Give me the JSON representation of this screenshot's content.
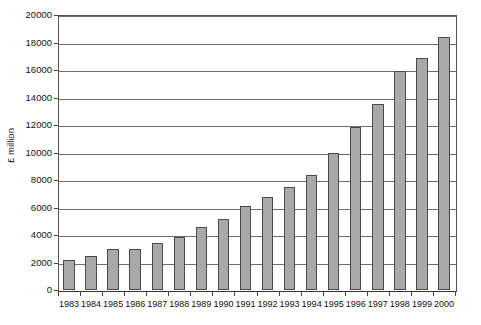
{
  "chart_data": {
    "type": "bar",
    "title": "",
    "subtitle": "",
    "xlabel": "",
    "ylabel": "£ million",
    "ylim": [
      0,
      20000
    ],
    "ytick_step": 2000,
    "yticks": [
      "20000",
      "18000",
      "16000",
      "14000",
      "12000",
      "10000",
      "8000",
      "6000",
      "4000",
      "2000",
      "0"
    ],
    "grid": true,
    "legend": false,
    "legend_position": "none",
    "bar_color": "#a9a9a9",
    "bar_border_color": "#4a4a4a",
    "axis_color": "#555555",
    "gridline_color": "#6e6e6e",
    "categories": [
      "1983",
      "1984",
      "1985",
      "1986",
      "1987",
      "1988",
      "1989",
      "1990",
      "1991",
      "1992",
      "1993",
      "1994",
      "1995",
      "1996",
      "1997",
      "1998",
      "1999",
      "2000"
    ],
    "values": [
      2150,
      2500,
      2950,
      3000,
      3400,
      3850,
      4600,
      5200,
      6100,
      6800,
      7500,
      8400,
      10000,
      11850,
      13550,
      15900,
      16850,
      18400
    ]
  }
}
